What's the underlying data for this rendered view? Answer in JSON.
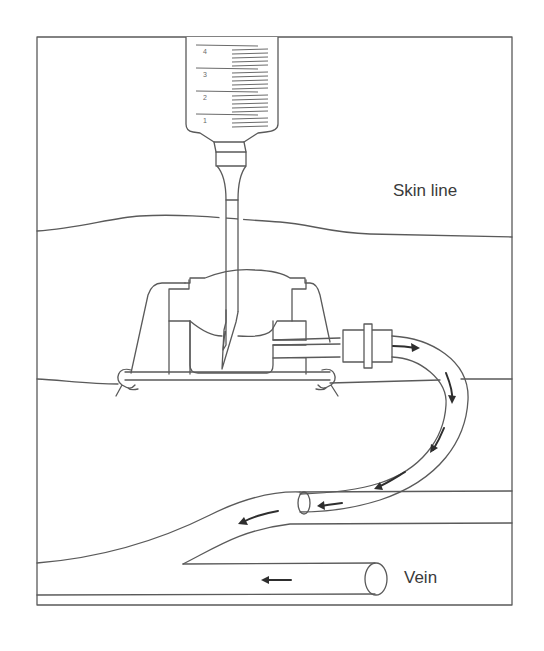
{
  "diagram": {
    "labels": {
      "skin_line": "Skin line",
      "vein": "Vein"
    },
    "syringe": {
      "scale_marks": [
        "4",
        "3",
        "2",
        "1"
      ]
    },
    "colors": {
      "line": "#5a5a5a",
      "arrow": "#2e2e2e",
      "background": "#ffffff"
    },
    "flow_arrows": {
      "count": 7,
      "direction": "from port through catheter into vein"
    }
  }
}
